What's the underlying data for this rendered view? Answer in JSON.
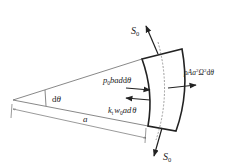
{
  "figure": {
    "type": "free-body diagram of curved ring element",
    "labels": {
      "s0_top": "S",
      "s0_top_sub": "0",
      "s0_bottom": "S",
      "s0_bottom_sub": "0",
      "pressure_force": "p₀bad θ",
      "pressure_force_main": "p",
      "pressure_force_sub": "0",
      "pressure_force_rest": "bad",
      "foundation_force_k": "k",
      "foundation_force_k_sub": "t",
      "foundation_force_w": "w",
      "foundation_force_w_sub": "0",
      "foundation_force_rest": "ad",
      "theta": "θ",
      "centrifugal_force": "ρAa²Ω²dθ",
      "centrifugal_rho": "ρAa",
      "centrifugal_sup1": "2",
      "centrifugal_omega": "Ω",
      "centrifugal_sup2": "2",
      "centrifugal_dtheta_d": "d",
      "centrifugal_dtheta_theta": "θ",
      "angle_label_d": "d",
      "angle_label_theta": "θ",
      "radius_label": "a"
    },
    "colors": {
      "line": "#222222",
      "thin_line": "#555555",
      "dashed": "#777777",
      "background": "#ffffff"
    }
  }
}
